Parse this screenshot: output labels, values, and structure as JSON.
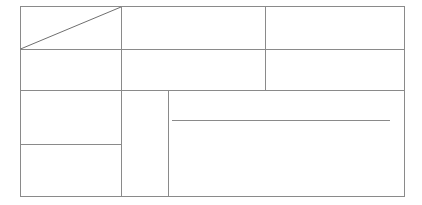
{
  "document": {
    "title": "Blank ruled form layout",
    "background_color": "#ffffff",
    "stroke_color": "#8a8a8a",
    "stroke_color_dark": "#6f6f6f",
    "stroke_width": 1,
    "canvas": {
      "width": 422,
      "height": 205
    }
  },
  "frame": {
    "label": "Outer form border",
    "x1": 20,
    "y1": 6,
    "x2": 404,
    "y2": 196
  },
  "chart_data": {
    "type": "table",
    "xlabel": "",
    "ylabel": "",
    "grid": true,
    "legend": "none",
    "xlim": [
      20,
      404
    ],
    "ylim": [
      6,
      196
    ],
    "categories": [
      "header-left-cell",
      "header-middle-cell",
      "header-right-cell",
      "row2-left-cell",
      "row2-middle-cell",
      "row2-right-cell",
      "body-left-upper-cell",
      "body-left-lower-cell",
      "body-narrow-column",
      "body-main-panel"
    ],
    "values": [
      1,
      1,
      1,
      1,
      1,
      1,
      1,
      1,
      1,
      1
    ],
    "annotations": [
      {
        "name": "diagonal-slash",
        "kind": "line",
        "x1": 20,
        "y1": 49,
        "x2": 121,
        "y2": 7,
        "note": "diagonal cancellation stroke across header-left-cell"
      },
      {
        "name": "main-panel-rule",
        "kind": "line",
        "x1": 171,
        "y1": 120,
        "x2": 390,
        "y2": 120,
        "note": "single writing rule inside main panel"
      }
    ]
  },
  "grid_lines": {
    "horizontal": [
      {
        "name": "header-row-divider",
        "y": 49,
        "x1": 20,
        "x2": 404,
        "note": "separates header row from second row"
      },
      {
        "name": "second-row-divider",
        "y": 90,
        "x1": 20,
        "x2": 404,
        "note": "separates second row from body section"
      },
      {
        "name": "left-column-divider",
        "y": 144,
        "x1": 20,
        "x2": 121,
        "note": "splits left body column into upper and lower cells"
      },
      {
        "name": "main-panel-rule",
        "y": 120,
        "x1": 171,
        "x2": 390,
        "note": "short rule inside the main panel"
      }
    ],
    "vertical": [
      {
        "name": "left-column-divider-vertical",
        "x": 121,
        "y1": 6,
        "y2": 196,
        "note": "full height divider after left column"
      },
      {
        "name": "header-right-divider",
        "x": 265,
        "y1": 6,
        "y2": 90,
        "note": "divider between middle and right header cells, stops at body"
      },
      {
        "name": "main-panel-left-edge",
        "x": 168,
        "y1": 90,
        "y2": 196,
        "note": "left edge of the large body panel"
      }
    ]
  },
  "cells": [
    {
      "name": "header-left-cell",
      "text": "",
      "x": 20,
      "y": 6,
      "w": 101,
      "h": 43
    },
    {
      "name": "header-middle-cell",
      "text": "",
      "x": 121,
      "y": 6,
      "w": 144,
      "h": 43
    },
    {
      "name": "header-right-cell",
      "text": "",
      "x": 265,
      "y": 6,
      "w": 139,
      "h": 43
    },
    {
      "name": "row2-left-cell",
      "text": "",
      "x": 20,
      "y": 49,
      "w": 101,
      "h": 41
    },
    {
      "name": "row2-middle-cell",
      "text": "",
      "x": 121,
      "y": 49,
      "w": 144,
      "h": 41
    },
    {
      "name": "row2-right-cell",
      "text": "",
      "x": 265,
      "y": 49,
      "w": 139,
      "h": 41
    },
    {
      "name": "body-left-upper-cell",
      "text": "",
      "x": 20,
      "y": 90,
      "w": 101,
      "h": 54
    },
    {
      "name": "body-left-lower-cell",
      "text": "",
      "x": 20,
      "y": 144,
      "w": 101,
      "h": 52
    },
    {
      "name": "body-narrow-column",
      "text": "",
      "x": 121,
      "y": 90,
      "w": 47,
      "h": 106
    },
    {
      "name": "body-main-panel",
      "text": "",
      "x": 168,
      "y": 90,
      "w": 236,
      "h": 106
    }
  ]
}
